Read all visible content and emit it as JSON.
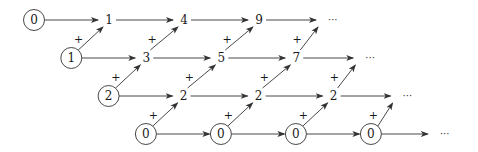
{
  "diagram": {
    "plus_label": "+",
    "ellipsis": "···",
    "rows": [
      {
        "name": "squares",
        "initial": "0",
        "values": [
          "1",
          "4",
          "9"
        ]
      },
      {
        "name": "first-differences",
        "initial": "1",
        "values": [
          "3",
          "5",
          "7"
        ]
      },
      {
        "name": "second-differences",
        "initial": "2",
        "values": [
          "2",
          "2",
          "2"
        ]
      },
      {
        "name": "third-differences",
        "initial": "0",
        "values": [
          "0",
          "0",
          "0"
        ]
      }
    ],
    "colors": {
      "stroke": "#333333",
      "text": "#1a1a1a",
      "background": "#ffffff"
    }
  }
}
